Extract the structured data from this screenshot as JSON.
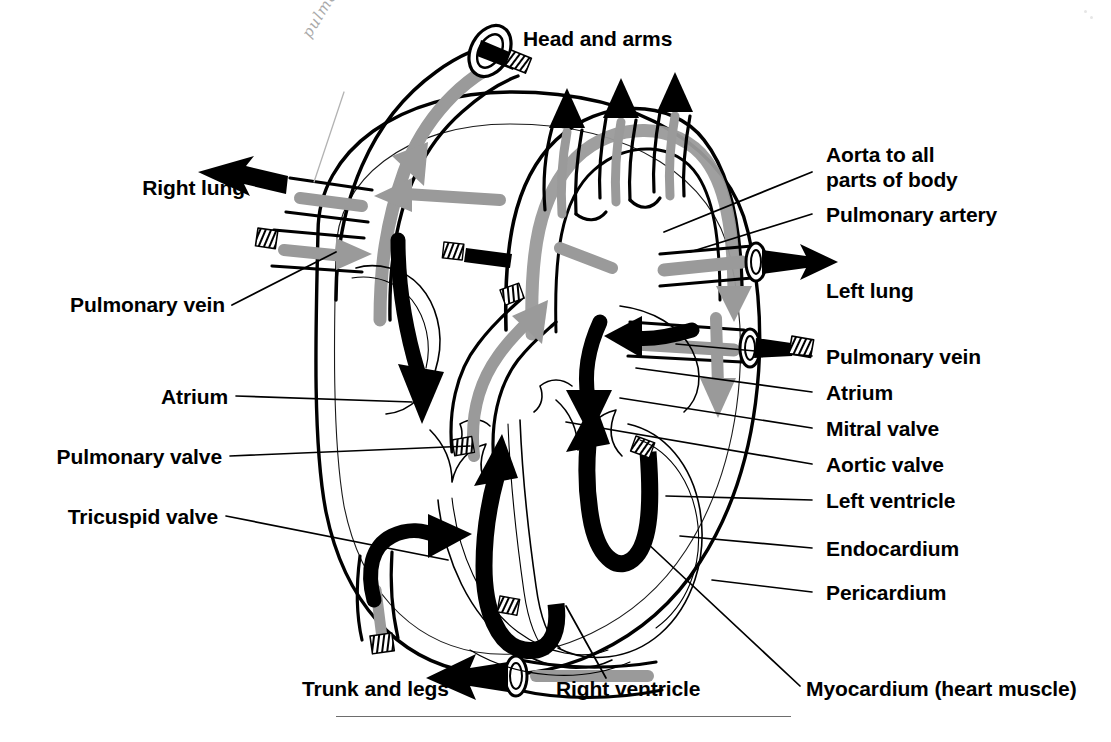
{
  "figure": {
    "colors": {
      "outline": "#000000",
      "flow_gray": "#9a9a9a",
      "flow_black": "#000000",
      "background": "#ffffff",
      "handwriting": "#a9a9a9",
      "rule": "#6d6d6d"
    }
  },
  "labels": {
    "head_and_arms": "Head and arms",
    "right_lung": "Right lung",
    "pulmonary_vein_left": "Pulmonary vein",
    "atrium_left": "Atrium",
    "pulmonary_valve": "Pulmonary valve",
    "tricuspid_valve": "Tricuspid valve",
    "aorta_line1": "Aorta to all",
    "aorta_line2": "parts of body",
    "pulmonary_artery": "Pulmonary artery",
    "left_lung": "Left lung",
    "pulmonary_vein_right": "Pulmonary vein",
    "atrium_right": "Atrium",
    "mitral_valve": "Mitral valve",
    "aortic_valve": "Aortic valve",
    "left_ventricle": "Left ventricle",
    "endocardium": "Endocardium",
    "pericardium": "Pericardium",
    "trunk_and_legs": "Trunk and legs",
    "right_ventricle": "Right ventricle",
    "myocardium": "Myocardium (heart muscle)"
  },
  "annotation": {
    "handwritten_note": "pulmonary artery",
    "style": "pencil cursive",
    "target": "pulmonary artery trunk"
  },
  "caption": {
    "partially_cut_off": true,
    "visible_fragment": ""
  }
}
